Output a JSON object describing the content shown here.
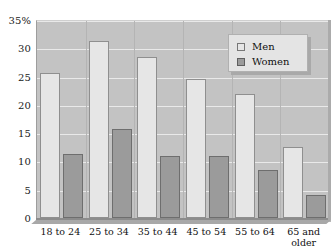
{
  "chart_data": {
    "type": "bar",
    "title": "",
    "subtitle": "",
    "xlabel": "",
    "ylabel": "",
    "ylim": [
      0,
      35
    ],
    "yticks": [
      0,
      5,
      10,
      15,
      20,
      25,
      30,
      35
    ],
    "ytick_labels": [
      "0",
      "5",
      "10",
      "15",
      "20",
      "25",
      "30",
      "35%"
    ],
    "grid": true,
    "legend_position": "top-right",
    "categories": [
      "18 to 24",
      "25 to 34",
      "35 to 44",
      "45 to 54",
      "55 to 64",
      "65 and older"
    ],
    "series": [
      {
        "name": "Men",
        "color": "#e6e6e6",
        "values": [
          25.7,
          31.3,
          28.4,
          24.6,
          21.9,
          12.5
        ]
      },
      {
        "name": "Women",
        "color": "#9b9b9b",
        "values": [
          11.3,
          15.8,
          10.9,
          10.9,
          8.5,
          4.0
        ]
      }
    ]
  },
  "legend": {
    "items": [
      {
        "label": "Men",
        "swatch": "light-square-swatch"
      },
      {
        "label": "Women",
        "swatch": "dark-square-swatch"
      }
    ]
  },
  "colors": {
    "plot_background": "#c3c3c3",
    "gridline": "#e9e9e9",
    "men_bar": "#e6e6e6",
    "women_bar": "#9b9b9b",
    "axis_text": "#111111",
    "legend_background": "#e4e4e4"
  }
}
